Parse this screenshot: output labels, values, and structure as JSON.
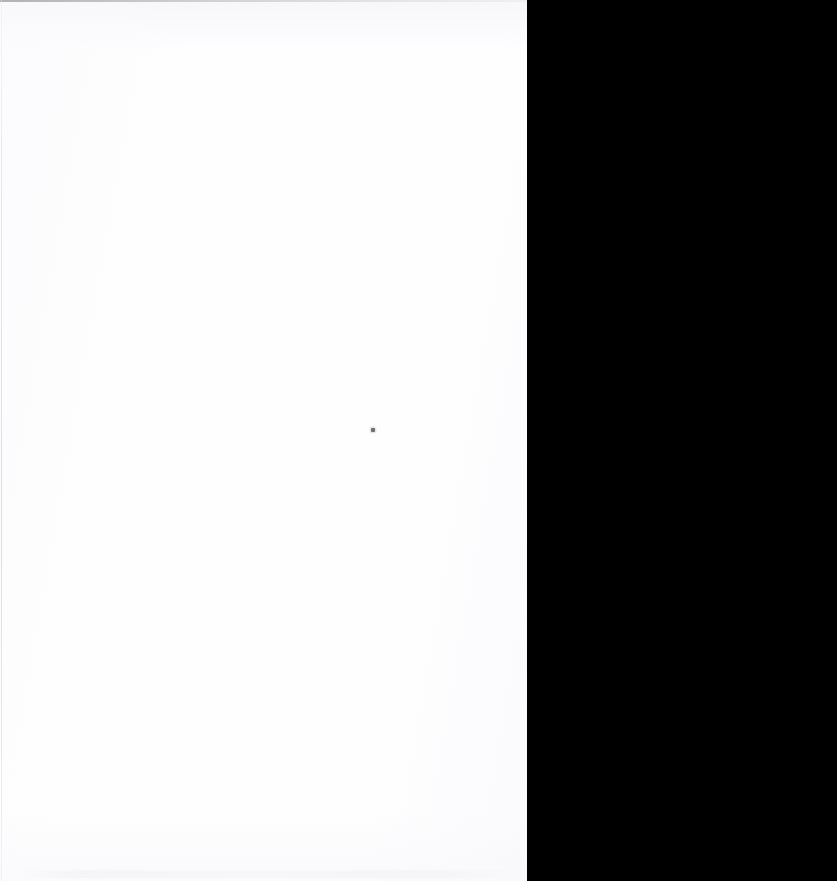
{
  "document": {
    "title": "Blank Scanned Page",
    "page_text": "",
    "visible_text_content": "",
    "description": "A scanned blank sheet occupying the left portion of the frame, with the scanner's black backing exposed along the right side."
  },
  "canvas": {
    "width_px": 837,
    "height_px": 881,
    "background_color": "#000000"
  },
  "regions": {
    "page_sheet": {
      "label": "",
      "color": "#fefeff",
      "left_px": 0,
      "top_px": 0,
      "right_edge_top_px": 551,
      "right_edge_bottom_px": 534,
      "height_px": 881
    },
    "scanner_backing": {
      "label": "",
      "color": "#000000",
      "left_edge_top_px": 551,
      "left_edge_bottom_px": 534,
      "right_px": 837,
      "height_px": 881
    }
  },
  "artifacts": {
    "top_hairline": {
      "label": "",
      "color": "#78787c",
      "x_px": 0,
      "y_px": 0,
      "width_px": 551,
      "height_px": 2
    },
    "left_hairline": {
      "label": "",
      "color": "#d6d6dc",
      "x_px": 1,
      "y_px": 0,
      "width_px": 1,
      "height_px": 881
    },
    "speck": {
      "label": "",
      "color": "#6e6e74",
      "x_px": 373,
      "y_px": 430,
      "width_px": 4,
      "height_px": 4
    },
    "bottom_ghost_band": {
      "label": "",
      "color": "#f0f0f4",
      "x_px": 20,
      "y_px": 870,
      "width_px": 500,
      "height_px": 8
    }
  }
}
